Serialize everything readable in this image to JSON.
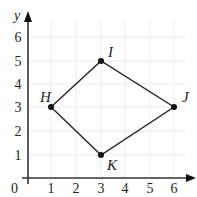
{
  "diagram": {
    "type": "coordinate-plane-quadrilateral",
    "axes": {
      "x_label": "",
      "y_label": "y",
      "origin_label": "0",
      "x_ticks": [
        "1",
        "2",
        "3",
        "4",
        "5",
        "6"
      ],
      "y_ticks": [
        "1",
        "2",
        "3",
        "4",
        "5",
        "6"
      ],
      "grid": true
    },
    "points": [
      {
        "name": "H",
        "x": 1,
        "y": 3
      },
      {
        "name": "I",
        "x": 3,
        "y": 5
      },
      {
        "name": "J",
        "x": 6,
        "y": 3
      },
      {
        "name": "K",
        "x": 3,
        "y": 1
      }
    ],
    "polygon_order": [
      "H",
      "I",
      "J",
      "K"
    ],
    "colors": {
      "axis": "#333333",
      "grid": "#ececec",
      "line": "#2a2a2a",
      "point": "#111111"
    }
  }
}
